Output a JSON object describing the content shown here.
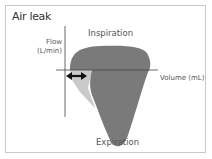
{
  "title": "Air leak",
  "axes": {
    "y_label_line1": "Flow",
    "y_label_line2": "(L/min)",
    "x_label": "Volume (mL)"
  },
  "annotations": {
    "top": "Inspiration",
    "bottom": "Expiration"
  },
  "colors": {
    "loop_fill": "#7a7a7a",
    "leak_fill": "#c9c9c9",
    "axis": "#444444",
    "arrow": "#111111",
    "border": "#c8c8c8"
  }
}
